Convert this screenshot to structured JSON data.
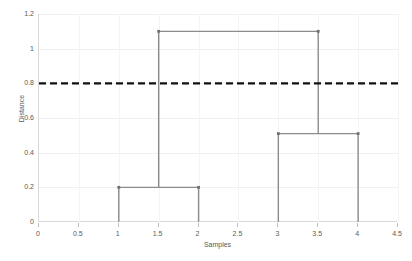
{
  "chart_data": {
    "type": "line",
    "subtype": "dendrogram",
    "title": "",
    "xlabel": "Samples",
    "ylabel": "Distance",
    "xlim": [
      0,
      4.5
    ],
    "ylim": [
      0,
      1.2
    ],
    "grid": true,
    "legend": "none",
    "xticks": [
      0,
      0.5,
      1,
      1.5,
      2,
      2.5,
      3,
      3.5,
      4,
      4.5
    ],
    "xtick_labels": [
      "0",
      "0.5",
      "1",
      "1.5",
      "2",
      "2.5",
      "3",
      "3.5",
      "4",
      "4.5"
    ],
    "yticks": [
      0,
      0.2,
      0.4,
      0.6,
      0.8,
      1,
      1.2
    ],
    "ytick_labels": [
      "0",
      "0.2",
      "0.4",
      "0.6",
      "0.8",
      "1",
      "1.2"
    ],
    "leaves": [
      {
        "label": "1",
        "x": 1
      },
      {
        "label": "2",
        "x": 2
      },
      {
        "label": "3",
        "x": 3
      },
      {
        "label": "4",
        "x": 4
      }
    ],
    "links": [
      {
        "id": "link-1-2",
        "x_left": 1,
        "x_right": 2,
        "y_left": 0,
        "y_right": 0,
        "height": 0.2
      },
      {
        "id": "link-3-4",
        "x_left": 3,
        "x_right": 4,
        "y_left": 0,
        "y_right": 0,
        "height": 0.51
      },
      {
        "id": "link-root",
        "x_left": 1.5,
        "x_right": 3.5,
        "y_left": 0.2,
        "y_right": 0.51,
        "height": 1.1
      }
    ],
    "threshold": {
      "value": 0.8,
      "style": "dashed",
      "color": "#111111",
      "label": ""
    },
    "line_color": "#8c8c8c",
    "grid_color": "#f0f0f0",
    "axis_color": "#d9d9d9",
    "tick_text_color": "#595959"
  }
}
